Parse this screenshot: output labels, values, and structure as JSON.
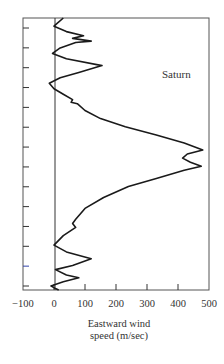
{
  "chart_data": {
    "type": "line",
    "title": "",
    "annotation": "Saturn",
    "xlabel": "Eastward wind speed (m/sec)",
    "xlabel_lines": [
      "Eastward wind",
      "speed (m/sec)"
    ],
    "ylabel": "",
    "xlim": [
      -100,
      500
    ],
    "x_ticks": [
      -100,
      0,
      100,
      200,
      300,
      400,
      500
    ],
    "x_tick_labels": [
      "−100",
      "0",
      "100",
      "200",
      "300",
      "400",
      "500"
    ],
    "y_axis": "latitude (unlabeled ticks), top = north",
    "y_tick_count": 14,
    "grid": false,
    "reference_line_x": 0,
    "series": [
      {
        "name": "Saturn eastward wind profile",
        "points_y_frac_x": [
          [
            0.0,
            30
          ],
          [
            0.02,
            10
          ],
          [
            0.03,
            0
          ],
          [
            0.05,
            40
          ],
          [
            0.065,
            95
          ],
          [
            0.075,
            60
          ],
          [
            0.085,
            120
          ],
          [
            0.09,
            70
          ],
          [
            0.11,
            20
          ],
          [
            0.13,
            -5
          ],
          [
            0.15,
            40
          ],
          [
            0.175,
            155
          ],
          [
            0.2,
            80
          ],
          [
            0.22,
            20
          ],
          [
            0.24,
            -15
          ],
          [
            0.26,
            0
          ],
          [
            0.28,
            30
          ],
          [
            0.3,
            60
          ],
          [
            0.31,
            55
          ],
          [
            0.315,
            75
          ],
          [
            0.34,
            100
          ],
          [
            0.37,
            150
          ],
          [
            0.4,
            230
          ],
          [
            0.43,
            330
          ],
          [
            0.46,
            420
          ],
          [
            0.485,
            480
          ],
          [
            0.5,
            430
          ],
          [
            0.515,
            415
          ],
          [
            0.53,
            440
          ],
          [
            0.545,
            475
          ],
          [
            0.56,
            420
          ],
          [
            0.59,
            330
          ],
          [
            0.62,
            240
          ],
          [
            0.66,
            160
          ],
          [
            0.7,
            100
          ],
          [
            0.74,
            70
          ],
          [
            0.755,
            60
          ],
          [
            0.77,
            70
          ],
          [
            0.8,
            30
          ],
          [
            0.835,
            0
          ],
          [
            0.86,
            40
          ],
          [
            0.885,
            120
          ],
          [
            0.91,
            60
          ],
          [
            0.925,
            5
          ],
          [
            0.945,
            40
          ],
          [
            0.955,
            80
          ],
          [
            0.97,
            30
          ],
          [
            0.985,
            -10
          ],
          [
            0.995,
            5
          ],
          [
            1.0,
            15
          ]
        ]
      }
    ],
    "colors": {
      "line": "#1a1a1a",
      "frame": "#444444",
      "tick_highlight": "#3344aa"
    }
  }
}
